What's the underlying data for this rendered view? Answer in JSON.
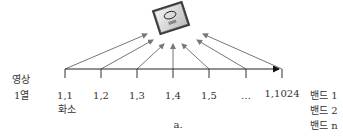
{
  "diagram": {
    "chip": {
      "icon": "cpu-chip-icon",
      "brand_text": "intel",
      "model_text": "Core i7"
    },
    "row_label": {
      "line1": "영상",
      "line2": "1열"
    },
    "pixels": [
      {
        "label": "1,1",
        "x": 65
      },
      {
        "label": "1,2",
        "x": 101
      },
      {
        "label": "1,3",
        "x": 137
      },
      {
        "label": "1,4",
        "x": 173
      },
      {
        "label": "1,5",
        "x": 209
      },
      {
        "label": "…",
        "x": 246
      },
      {
        "label": "1,1024",
        "x": 282
      }
    ],
    "pixel_caption": "화소",
    "bands": [
      "밴드 1",
      "밴드 2",
      "밴드 n"
    ],
    "caption": "a.",
    "colors": {
      "arrow": "#777777",
      "axis": "#222222",
      "text": "#333333"
    }
  }
}
